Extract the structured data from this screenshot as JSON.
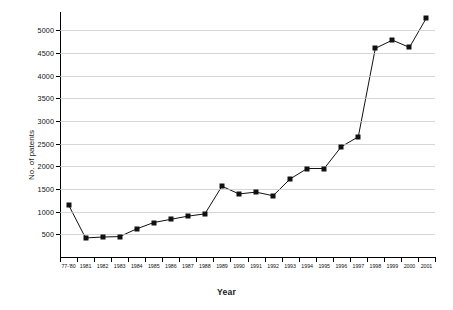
{
  "chart_data": {
    "type": "line",
    "title": "",
    "xlabel": "Year",
    "ylabel": "No. of patents",
    "grid": true,
    "legend": null,
    "ylim": [
      0,
      5400
    ],
    "yticks": [
      500,
      1000,
      1500,
      2000,
      2500,
      3000,
      3500,
      4000,
      4500,
      5000
    ],
    "ytick_labels": [
      "500",
      "1000",
      "1500",
      "2000",
      "2500",
      "3000",
      "3500",
      "4000",
      "4500",
      "5000"
    ],
    "categories": [
      "77-'80",
      "1981",
      "1982",
      "1983",
      "1984",
      "1985",
      "1986",
      "1987",
      "1988",
      "1989",
      "1990",
      "1991",
      "1992",
      "1993",
      "1994",
      "1995",
      "1996",
      "1997",
      "1998",
      "1999",
      "2000",
      "2001"
    ],
    "values": [
      1150,
      420,
      440,
      450,
      620,
      760,
      830,
      900,
      950,
      1560,
      1390,
      1430,
      1350,
      1720,
      1950,
      1950,
      2430,
      2650,
      4600,
      4780,
      4620,
      5270
    ],
    "marker": "square",
    "marker_color": "#111111",
    "line_color": "#111111"
  }
}
